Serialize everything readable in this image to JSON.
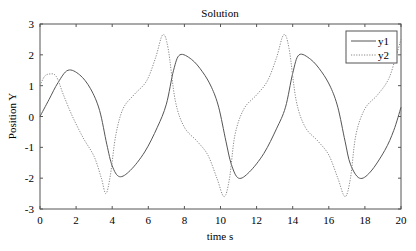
{
  "chart_data": {
    "type": "line",
    "title": "Solution",
    "xlabel": "time s",
    "ylabel": "Position Y",
    "xlim": [
      0,
      20
    ],
    "ylim": [
      -3,
      3
    ],
    "xticks": [
      0,
      2,
      4,
      6,
      8,
      10,
      12,
      14,
      16,
      18,
      20
    ],
    "yticks": [
      -3,
      -2,
      -1,
      0,
      1,
      2,
      3
    ],
    "grid": false,
    "legend_position": "upper right",
    "series": [
      {
        "name": "y1",
        "style": "solid",
        "color": "#555555",
        "x": [
          0,
          0.5,
          1.0,
          1.55,
          2.2,
          2.8,
          3.3,
          3.7,
          4.0,
          4.4,
          5.0,
          5.8,
          6.5,
          7.0,
          7.4,
          7.75,
          8.4,
          9.0,
          9.5,
          9.9,
          10.3,
          10.6,
          11.0,
          11.6,
          12.4,
          13.1,
          13.6,
          14.0,
          14.35,
          15.0,
          15.6,
          16.1,
          16.5,
          16.9,
          17.2,
          17.7,
          18.3,
          19.1,
          19.6,
          20.0
        ],
        "values": [
          0,
          0.55,
          1.1,
          1.5,
          1.35,
          0.9,
          0.2,
          -0.9,
          -1.6,
          -1.95,
          -1.75,
          -1.15,
          -0.35,
          0.4,
          1.5,
          2.0,
          1.85,
          1.45,
          0.95,
          0.3,
          -0.8,
          -1.55,
          -2.0,
          -1.8,
          -1.2,
          -0.4,
          0.3,
          1.4,
          2.0,
          1.85,
          1.45,
          0.95,
          0.3,
          -0.8,
          -1.55,
          -2.0,
          -1.8,
          -1.1,
          -0.45,
          0.3
        ]
      },
      {
        "name": "y2",
        "style": "dotted",
        "color": "#888888",
        "x": [
          0,
          0.25,
          0.55,
          0.9,
          1.3,
          1.8,
          2.4,
          3.0,
          3.4,
          3.65,
          3.9,
          4.2,
          4.6,
          5.2,
          5.9,
          6.4,
          6.8,
          7.1,
          7.5,
          8.0,
          8.7,
          9.3,
          9.8,
          10.2,
          10.5,
          10.8,
          11.3,
          12.0,
          12.6,
          13.1,
          13.5,
          13.8,
          14.2,
          14.7,
          15.4,
          16.0,
          16.5,
          16.9,
          17.2,
          17.5,
          18.0,
          18.7,
          19.3,
          19.7,
          20.0
        ],
        "values": [
          1.0,
          1.3,
          1.38,
          1.3,
          0.7,
          0.0,
          -0.7,
          -1.3,
          -2.0,
          -2.5,
          -1.9,
          -0.6,
          0.25,
          0.7,
          1.15,
          1.9,
          2.65,
          2.2,
          0.5,
          -0.35,
          -0.8,
          -1.25,
          -2.0,
          -2.6,
          -2.0,
          -0.6,
          0.25,
          0.7,
          1.15,
          1.9,
          2.65,
          2.2,
          0.5,
          -0.35,
          -0.8,
          -1.25,
          -2.0,
          -2.6,
          -2.0,
          -0.6,
          0.25,
          0.7,
          1.2,
          1.9,
          2.5
        ]
      }
    ]
  },
  "colors": {
    "axes": "#555555",
    "background": "#ffffff"
  }
}
